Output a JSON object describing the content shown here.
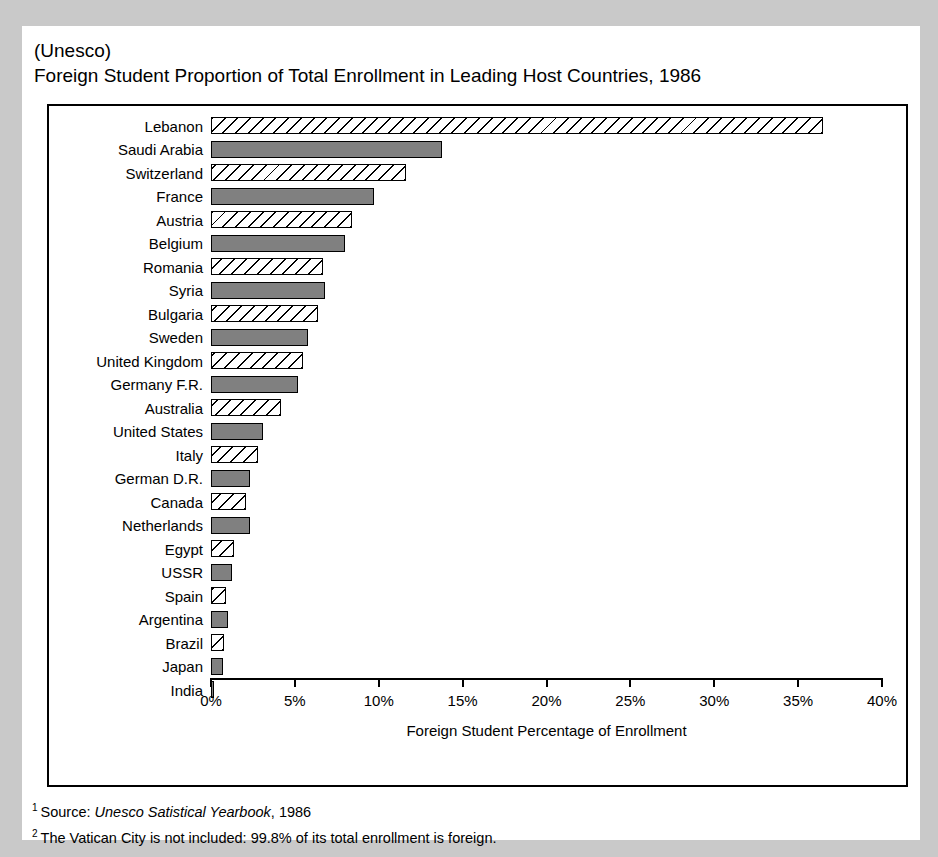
{
  "header": {
    "source_tag": "(Unesco)",
    "title": "Foreign Student Proportion of Total Enrollment in Leading Host Countries, 1986"
  },
  "axis": {
    "y_title_letters": [
      "H",
      "o",
      "s",
      "t",
      "",
      "C",
      "o",
      "u",
      "n",
      "t",
      "r",
      "y"
    ],
    "y_title_text": "Host Country",
    "x_title": "Foreign Student Percentage of Enrollment",
    "x_ticks": [
      "0%",
      "5%",
      "10%",
      "15%",
      "20%",
      "25%",
      "30%",
      "35%",
      "40%"
    ]
  },
  "footnotes": [
    {
      "marker": "1",
      "pre": "Source:  ",
      "italic": "Unesco Satistical Yearbook",
      "post": ", 1986"
    },
    {
      "marker": "2",
      "pre": "The Vatican City is not included:  99.8% of its total enrollment is foreign.",
      "italic": "",
      "post": ""
    }
  ],
  "colors": {
    "page_background": "#c9c9c9",
    "card_background": "#ffffff",
    "bar_solid_fill": "#808080",
    "bar_hatch_fill": "#ffffff",
    "outline": "#000000"
  },
  "chart_data": {
    "type": "bar",
    "orientation": "horizontal",
    "title": "Foreign Student Proportion of Total Enrollment in Leading Host Countries, 1986",
    "subtitle": "(Unesco)",
    "xlabel": "Foreign Student Percentage of Enrollment",
    "ylabel": "Host Country",
    "xlim": [
      0,
      40
    ],
    "xtick_values": [
      0,
      5,
      10,
      15,
      20,
      25,
      30,
      35,
      40
    ],
    "xtick_labels": [
      "0%",
      "5%",
      "10%",
      "15%",
      "20%",
      "25%",
      "30%",
      "35%",
      "40%"
    ],
    "grid": false,
    "legend": "none",
    "units": "percent",
    "categories": [
      "Lebanon",
      "Saudi Arabia",
      "Switzerland",
      "France",
      "Austria",
      "Belgium",
      "Romania",
      "Syria",
      "Bulgaria",
      "Sweden",
      "United Kingdom",
      "Germany F.R.",
      "Australia",
      "United States",
      "Italy",
      "German D.R.",
      "Canada",
      "Netherlands",
      "Egypt",
      "USSR",
      "Spain",
      "Argentina",
      "Brazil",
      "Japan",
      "India"
    ],
    "values": [
      36.5,
      13.8,
      11.6,
      9.7,
      8.4,
      8.0,
      6.7,
      6.8,
      6.4,
      5.8,
      5.5,
      5.2,
      4.2,
      3.1,
      2.8,
      2.3,
      2.1,
      2.3,
      1.4,
      1.25,
      0.9,
      1.0,
      0.8,
      0.7,
      0.2
    ],
    "fills": [
      "hatch",
      "solid",
      "hatch",
      "solid",
      "hatch",
      "solid",
      "hatch",
      "solid",
      "hatch",
      "solid",
      "hatch",
      "solid",
      "hatch",
      "solid",
      "hatch",
      "solid",
      "hatch",
      "solid",
      "hatch",
      "solid",
      "hatch",
      "solid",
      "hatch",
      "solid",
      "solid"
    ]
  }
}
